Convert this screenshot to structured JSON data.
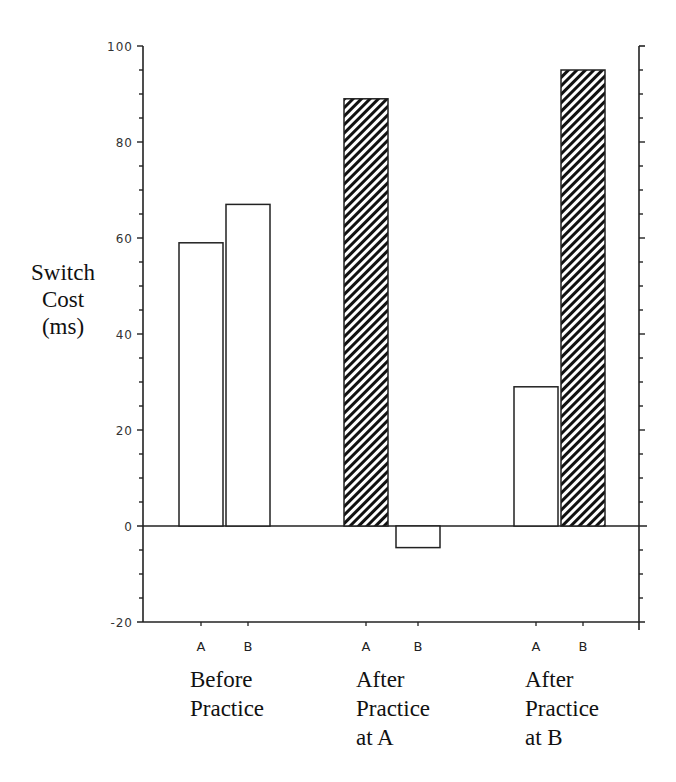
{
  "chart_data": {
    "type": "bar",
    "title": "",
    "ylabel_lines": [
      "Switch",
      "Cost",
      "(ms)"
    ],
    "ylabel": "Switch Cost (ms)",
    "xlabel": "",
    "ylim": [
      -20,
      100
    ],
    "yticks": [
      -20,
      0,
      20,
      40,
      60,
      80,
      100
    ],
    "ytick_labels": [
      "-20",
      "0",
      "20",
      "40",
      "60",
      "80",
      "100"
    ],
    "minor_ytick_step": 5,
    "grid": false,
    "legend": null,
    "groups": [
      {
        "name": "Before Practice",
        "label_lines": [
          "Before",
          "Practice"
        ],
        "bars": [
          {
            "category": "A",
            "value": 59,
            "fill": "open"
          },
          {
            "category": "B",
            "value": 67,
            "fill": "open"
          }
        ]
      },
      {
        "name": "After Practice at A",
        "label_lines": [
          "After",
          "Practice",
          "at A"
        ],
        "bars": [
          {
            "category": "A",
            "value": 89,
            "fill": "hatched"
          },
          {
            "category": "B",
            "value": -4.5,
            "fill": "open"
          }
        ]
      },
      {
        "name": "After Practice at B",
        "label_lines": [
          "After",
          "Practice",
          "at B"
        ],
        "bars": [
          {
            "category": "A",
            "value": 29,
            "fill": "open"
          },
          {
            "category": "B",
            "value": 95,
            "fill": "hatched"
          }
        ]
      }
    ],
    "categories": [
      "Before Practice A",
      "Before Practice B",
      "After Practice at A A",
      "After Practice at A B",
      "After Practice at B A",
      "After Practice at B B"
    ],
    "values": [
      59,
      67,
      89,
      -4.5,
      29,
      95
    ],
    "colors": {
      "axis": "#222222",
      "bar_stroke": "#222222",
      "open_fill": "#ffffff",
      "hatch": "#111111"
    }
  }
}
